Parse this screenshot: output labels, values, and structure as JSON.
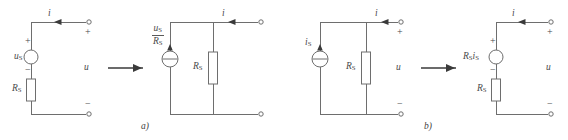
{
  "figure": {
    "background": "#ffffff",
    "line_color": "#6e6e6e",
    "text_color": "#4a4a4a",
    "width": 568,
    "height": 140
  },
  "captions": {
    "a": "a)",
    "b": "b)"
  },
  "panel_a": {
    "title": "voltage-source to current-source equivalent transformation",
    "left_circuit": {
      "type": "real-voltage-source",
      "source_label_main": "u",
      "source_label_sub": "S",
      "resistor_label_main": "R",
      "resistor_label_sub": "S",
      "current_label": "i",
      "voltage_label": "u",
      "plus_source": "+",
      "minus_source": "−",
      "plus_terminal": "+",
      "minus_terminal": "−"
    },
    "transform_arrow": "→",
    "right_circuit": {
      "type": "real-current-source",
      "source_numerator_main": "u",
      "source_numerator_sub": "S",
      "source_denominator_main": "R",
      "source_denominator_sub": "S",
      "resistor_label_main": "R",
      "resistor_label_sub": "S",
      "current_label": "i"
    }
  },
  "panel_b": {
    "title": "current-source to voltage-source equivalent transformation",
    "left_circuit": {
      "type": "real-current-source",
      "source_label_main": "i",
      "source_label_sub": "S",
      "resistor_label_main": "R",
      "resistor_label_sub": "S",
      "current_label": "i",
      "voltage_label": "u",
      "plus_terminal": "+",
      "minus_terminal": "−"
    },
    "transform_arrow": "→",
    "right_circuit": {
      "type": "real-voltage-source",
      "source_label_r_main": "R",
      "source_label_r_sub": "S",
      "source_label_i_main": "i",
      "source_label_i_sub": "S",
      "resistor_label_main": "R",
      "resistor_label_sub": "S",
      "current_label": "i",
      "voltage_label": "u",
      "plus_source": "+",
      "minus_source": "−",
      "plus_terminal": "+",
      "minus_terminal": "−"
    }
  }
}
